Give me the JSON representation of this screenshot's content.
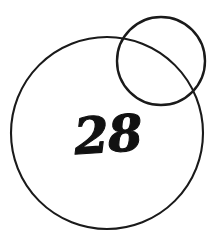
{
  "figure": {
    "canvas": {
      "width": 222,
      "height": 246,
      "background_color": "#ffffff"
    },
    "stroke_color": "#1a1a1a",
    "label_color": "#111111",
    "label_text": "28",
    "shapes": [
      {
        "name": "large-circle",
        "type": "circle",
        "cx": 107,
        "cy": 133,
        "r": 96,
        "stroke_width": 2.1,
        "fill": "none"
      },
      {
        "name": "small-circle",
        "type": "circle",
        "cx": 161,
        "cy": 61,
        "r": 44,
        "stroke_width": 2.4,
        "fill": "none"
      }
    ],
    "label": {
      "text": "28",
      "x": 109,
      "y": 152,
      "font_size": 50,
      "rotation": -4
    }
  }
}
